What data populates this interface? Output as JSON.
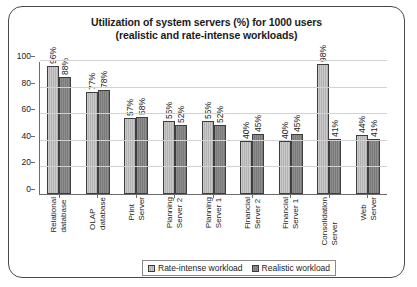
{
  "chart_data": {
    "type": "bar",
    "title": "Utilization of system servers (%) for 1000 users",
    "subtitle": "(realistic and rate-intense workloads)",
    "title_line1": "Utilization of system servers (%) for 1000 users",
    "title_line2": "(realistic and rate-intense workloads)",
    "xlabel": "",
    "ylabel": "",
    "ylim": [
      0,
      100
    ],
    "yticks": [
      0,
      20,
      40,
      60,
      80,
      100
    ],
    "grid": true,
    "legend_position": "bottom-center",
    "categories": [
      "Relational database",
      "OLAP database",
      "Print Server",
      "Planning Server 2",
      "Planning Server 1",
      "Financial Server 2",
      "Financial Server 1",
      "Consolidation Server",
      "Web Server"
    ],
    "series": [
      {
        "name": "Rate-intense workload",
        "color": "#c2c2c2",
        "values": [
          96,
          77,
          57,
          55,
          55,
          40,
          40,
          98,
          44
        ],
        "labels": [
          "96%",
          "77%",
          "57%",
          "55%",
          "55%",
          "40%",
          "40%",
          "98%",
          "44%"
        ]
      },
      {
        "name": "Realistic workload",
        "color": "#808080",
        "values": [
          88,
          78,
          58,
          52,
          52,
          45,
          45,
          41,
          41
        ],
        "labels": [
          "88%",
          "78%",
          "58%",
          "52%",
          "52%",
          "45%",
          "45%",
          "41%",
          "41%"
        ]
      }
    ]
  }
}
